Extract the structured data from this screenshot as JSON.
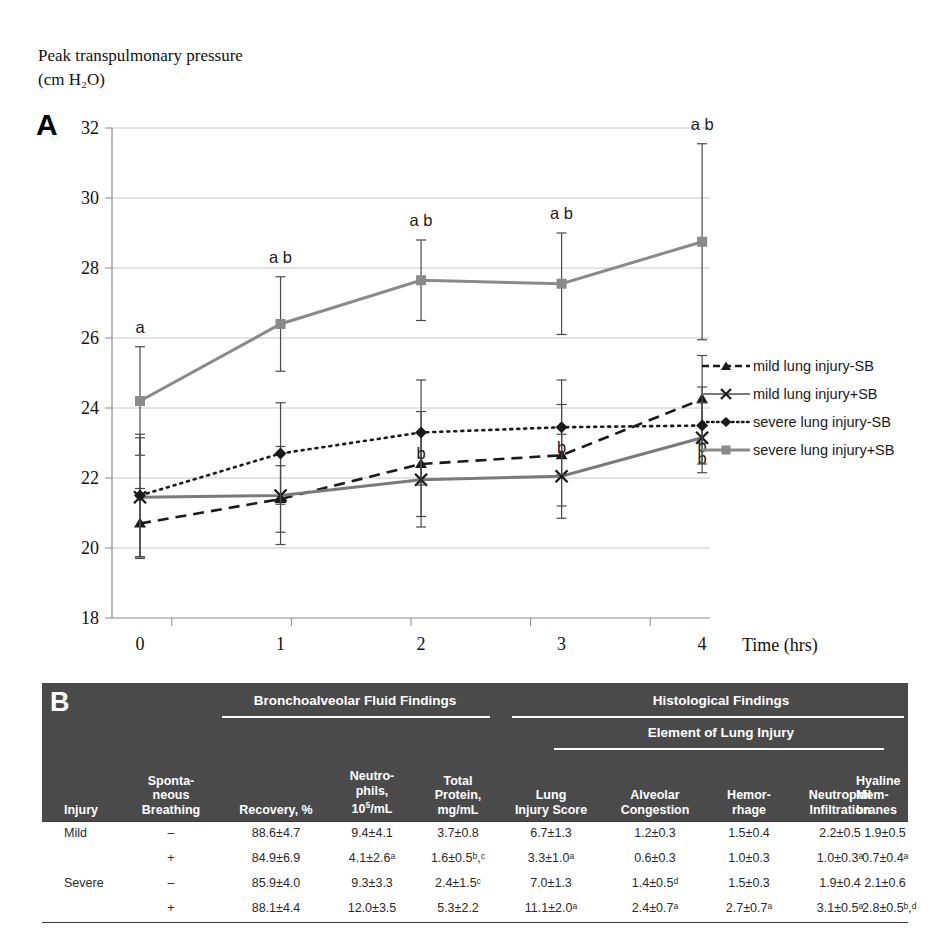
{
  "panelA": {
    "letter": "A",
    "y_axis_title": "Peak transpulmonary pressure\n(cm H₂O)",
    "x_axis_title": "Time (hrs)",
    "legend": [
      {
        "label": "mild lung injury-SB",
        "key": "dashed-triangle"
      },
      {
        "label": "mild lung injury+SB",
        "key": "solid-x"
      },
      {
        "label": "severe lung injury-SB",
        "key": "dotted-diamond"
      },
      {
        "label": "severe lung injury+SB",
        "key": "solid-square"
      }
    ]
  },
  "chart_data": {
    "type": "line",
    "title": "",
    "xlabel": "Time (hrs)",
    "ylabel": "Peak transpulmonary pressure (cm H2O)",
    "x": [
      0,
      1,
      2,
      3,
      4
    ],
    "xticks": [
      "0",
      "1",
      "2",
      "3",
      "4"
    ],
    "yticks": [
      "18",
      "20",
      "22",
      "24",
      "26",
      "28",
      "30",
      "32"
    ],
    "ylim": [
      18,
      32
    ],
    "grid": true,
    "legend_position": "right",
    "series": [
      {
        "name": "mild lung injury-SB",
        "style": "dashed",
        "marker": "triangle",
        "color": "#1a1a1a",
        "values": [
          20.7,
          21.4,
          22.4,
          22.65,
          24.25
        ],
        "errors": [
          1.0,
          0.95,
          1.5,
          1.45,
          1.25
        ],
        "annotations": [
          "",
          "",
          "",
          "",
          ""
        ]
      },
      {
        "name": "mild lung injury+SB",
        "style": "solid",
        "marker": "x",
        "color": "#7a7a7a",
        "values": [
          21.45,
          21.5,
          21.95,
          22.05,
          23.15
        ],
        "errors": [
          1.7,
          1.4,
          1.35,
          1.2,
          1.0
        ],
        "annotations": [
          "",
          "",
          "",
          "",
          "b"
        ]
      },
      {
        "name": "severe lung injury-SB",
        "style": "dotted",
        "marker": "diamond",
        "color": "#1a1a1a",
        "values": [
          21.5,
          22.7,
          23.3,
          23.45,
          23.5
        ],
        "errors": [
          1.75,
          1.45,
          1.5,
          1.35,
          1.1
        ],
        "annotations": [
          "",
          "",
          "b",
          "b",
          "b"
        ]
      },
      {
        "name": "severe lung injury+SB",
        "style": "solid",
        "marker": "square",
        "color": "#8a8a8a",
        "values": [
          24.2,
          26.4,
          27.65,
          27.55,
          28.75
        ],
        "errors": [
          1.55,
          1.35,
          1.15,
          1.45,
          2.8
        ],
        "annotations": [
          "a",
          "a b",
          "a b",
          "a b",
          "a b"
        ]
      }
    ]
  },
  "panelB": {
    "letter": "B",
    "group_headers": [
      {
        "label": "Bronchoalveolar Fluid Findings"
      },
      {
        "label": "Histological Findings"
      },
      {
        "label": "Element of Lung Injury"
      }
    ],
    "columns": [
      {
        "label": "Injury"
      },
      {
        "label": "Sponta-\nneous\nBreathing"
      },
      {
        "label": "Recovery, %"
      },
      {
        "label": "Neutro-\nphils,\n10⁵/mL"
      },
      {
        "label": "Total\nProtein,\nmg/mL"
      },
      {
        "label": "Lung\nInjury Score"
      },
      {
        "label": "Alveolar\nCongestion"
      },
      {
        "label": "Hemor-\nrhage"
      },
      {
        "label": "Neutrophil\nInfiltration"
      },
      {
        "label": "Hyaline\nMem-\nbranes"
      }
    ],
    "rows": [
      {
        "injury": "Mild",
        "sb": "–",
        "recovery": "88.6±4.7",
        "neutrophils": "9.4±4.1",
        "total_protein": "3.7±0.8",
        "lung_injury_score": "6.7±1.3",
        "alveolar_congestion": "1.2±0.3",
        "hemorrhage": "1.5±0.4",
        "neutrophil_infiltration": "2.2±0.5",
        "hyaline_membranes": "1.9±0.5"
      },
      {
        "injury": "",
        "sb": "+",
        "recovery": "84.9±6.9",
        "neutrophils": "4.1±2.6ᵃ",
        "total_protein": "1.6±0.5ᵇ,ᶜ",
        "lung_injury_score": "3.3±1.0ᵃ",
        "alveolar_congestion": "0.6±0.3",
        "hemorrhage": "1.0±0.3",
        "neutrophil_infiltration": "1.0±0.3ᵃ",
        "hyaline_membranes": "0.7±0.4ᵃ"
      },
      {
        "injury": "Severe",
        "sb": "–",
        "recovery": "85.9±4.0",
        "neutrophils": "9.3±3.3",
        "total_protein": "2.4±1.5ᶜ",
        "lung_injury_score": "7.0±1.3",
        "alveolar_congestion": "1.4±0.5ᵈ",
        "hemorrhage": "1.5±0.3",
        "neutrophil_infiltration": "1.9±0.4",
        "hyaline_membranes": "2.1±0.6"
      },
      {
        "injury": "",
        "sb": "+",
        "recovery": "88.1±4.4",
        "neutrophils": "12.0±3.5",
        "total_protein": "5.3±2.2",
        "lung_injury_score": "11.1±2.0ᵃ",
        "alveolar_congestion": "2.4±0.7ᵃ",
        "hemorrhage": "2.7±0.7ᵃ",
        "neutrophil_infiltration": "3.1±0.5ᵃ",
        "hyaline_membranes": "2.8±0.5ᵇ,ᵈ"
      }
    ]
  },
  "colors": {
    "table_header_bg": "#4a4a4a",
    "severe_sb_line": "#8a8a8a",
    "mild_sb_line": "#7a7a7a",
    "dark_line": "#1a1a1a",
    "gridline": "#c8c8c8"
  }
}
